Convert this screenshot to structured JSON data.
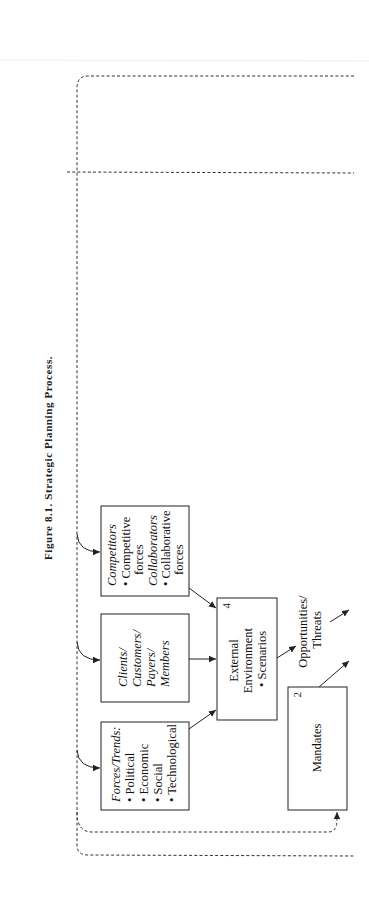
{
  "figure": {
    "title": "Figure 8.1. Strategic Planning Process."
  },
  "boxes": {
    "competitors": {
      "lines": [
        "Competitors",
        "• Competitive",
        "  forces",
        "Collaborators",
        "• Collaborative",
        "  forces"
      ]
    },
    "clients": {
      "lines": [
        "Clients/",
        "Customers/",
        "Payers/",
        "Members"
      ]
    },
    "forces": {
      "lines": [
        "Forces/Trends:",
        "• Political",
        "• Economic",
        "• Social",
        "• Technological"
      ]
    },
    "external": {
      "number": "4",
      "lines": [
        "External",
        "Environment",
        "• Scenarios"
      ]
    },
    "mandates": {
      "number": "2",
      "label": "Mandates"
    }
  },
  "labels": {
    "opportunities_line1": "Opportunities/",
    "opportunities_line2": "Threats"
  },
  "colors": {
    "ink": "#222222",
    "background": "#ffffff"
  }
}
